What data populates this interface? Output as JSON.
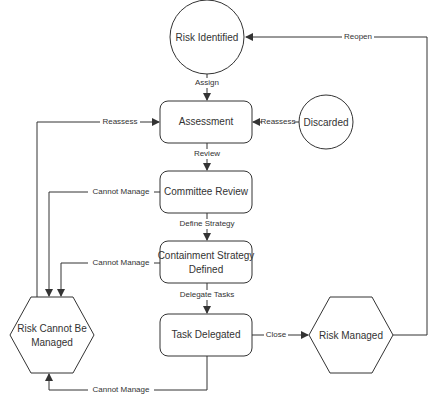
{
  "diagram": {
    "type": "state-flowchart",
    "nodes": {
      "risk_identified": {
        "label": "Risk Identified",
        "shape": "circle"
      },
      "assessment": {
        "label": "Assessment",
        "shape": "rounded-rect"
      },
      "discarded": {
        "label": "Discarded",
        "shape": "circle"
      },
      "committee_review": {
        "label": "Committee Review",
        "shape": "rounded-rect"
      },
      "containment_line1": {
        "label": "Containment Strategy",
        "shape": "rounded-rect"
      },
      "containment_line2": {
        "label": "Defined",
        "shape": "rounded-rect"
      },
      "task_delegated": {
        "label": "Task Delegated",
        "shape": "rounded-rect"
      },
      "cannot_line1": {
        "label": "Risk Cannot Be",
        "shape": "hexagon"
      },
      "cannot_line2": {
        "label": "Managed",
        "shape": "hexagon"
      },
      "risk_managed": {
        "label": "Risk Managed",
        "shape": "hexagon"
      }
    },
    "edges": {
      "assign": {
        "from": "Risk Identified",
        "to": "Assessment",
        "label": "Assign"
      },
      "review": {
        "from": "Assessment",
        "to": "Committee Review",
        "label": "Review"
      },
      "define_strategy": {
        "from": "Committee Review",
        "to": "Containment Strategy Defined",
        "label": "Define Strategy"
      },
      "delegate_tasks": {
        "from": "Containment Strategy Defined",
        "to": "Task Delegated",
        "label": "Delegate Tasks"
      },
      "close": {
        "from": "Task Delegated",
        "to": "Risk Managed",
        "label": "Close"
      },
      "reopen": {
        "from": "Risk Managed",
        "to": "Risk Identified",
        "label": "Reopen"
      },
      "reassess_discarded": {
        "from": "Discarded",
        "to": "Assessment",
        "label": "Reassess"
      },
      "reassess_cannot": {
        "from": "Risk Cannot Be Managed",
        "to": "Assessment",
        "label": "Reassess"
      },
      "cannot_manage_committee": {
        "from": "Committee Review",
        "to": "Risk Cannot Be Managed",
        "label": "Cannot Manage"
      },
      "cannot_manage_containment": {
        "from": "Containment Strategy Defined",
        "to": "Risk Cannot Be Managed",
        "label": "Cannot Manage"
      },
      "cannot_manage_task": {
        "from": "Task Delegated",
        "to": "Risk Cannot Be Managed",
        "label": "Cannot Manage"
      }
    }
  }
}
